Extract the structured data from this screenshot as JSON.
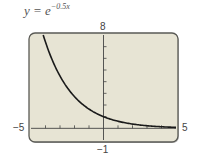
{
  "chart_data": {
    "type": "line",
    "title_base": "y = e",
    "title_exponent": "−0.5x",
    "function": "exp(-0.5*x)",
    "xlabel": "",
    "ylabel": "",
    "xlim": [
      -5,
      5
    ],
    "ylim": [
      -1,
      8
    ],
    "x_tick_step": 1,
    "y_tick_step": 1,
    "grid": false,
    "window_labels": {
      "xmin": "−5",
      "xmax": "5",
      "ymin": "−1",
      "ymax": "8"
    },
    "series": [
      {
        "name": "y = e^(-0.5x)",
        "x": [
          -4.17,
          -4,
          -3,
          -2,
          -1,
          0,
          1,
          2,
          3,
          4,
          5
        ],
        "y": [
          8.0,
          7.39,
          4.48,
          2.72,
          1.65,
          1.0,
          0.61,
          0.37,
          0.22,
          0.14,
          0.08
        ]
      }
    ],
    "colors": {
      "frame_fill": "#e7e4d4",
      "frame_border": "#5a5a55",
      "curve": "#1a1a1a",
      "axis": "#444444"
    }
  }
}
